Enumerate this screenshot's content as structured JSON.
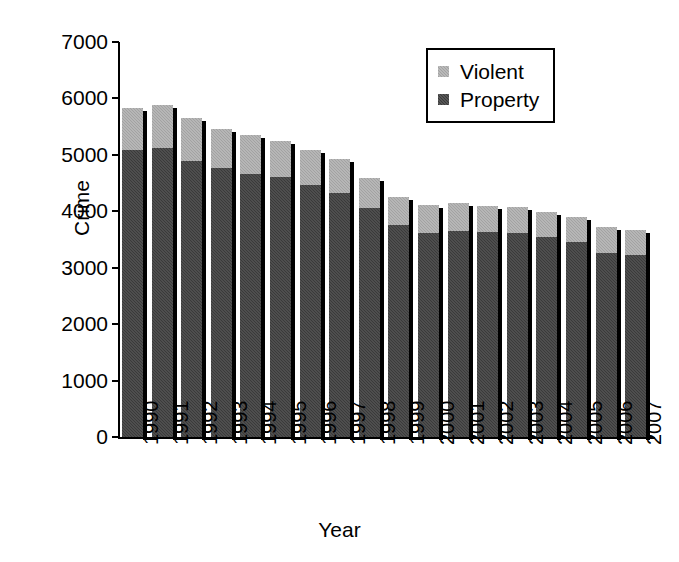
{
  "chart_data": {
    "type": "bar",
    "title": "",
    "subtitle": "",
    "stacked": true,
    "xlabel": "Year",
    "ylabel": "Crime",
    "ylim": [
      0,
      7000
    ],
    "ytick_step": 1000,
    "yticks": [
      "7000",
      "6000",
      "5000",
      "4000",
      "3000",
      "2000",
      "1000",
      "0"
    ],
    "grid": false,
    "legend_position": "top-right",
    "categories": [
      "1990",
      "1991",
      "1992",
      "1993",
      "1994",
      "1995",
      "1996",
      "1997",
      "1998",
      "1999",
      "2000",
      "2001",
      "2002",
      "2003",
      "2004",
      "2005",
      "2006",
      "2007"
    ],
    "series": [
      {
        "name": "Property",
        "color": "#3a3a3a",
        "values": [
          5090,
          5120,
          4900,
          4760,
          4660,
          4600,
          4470,
          4320,
          4060,
          3750,
          3620,
          3650,
          3640,
          3620,
          3540,
          3450,
          3260,
          3220
        ]
      },
      {
        "name": "Violent",
        "color": "#a2a2a2",
        "values": [
          740,
          760,
          760,
          690,
          700,
          640,
          620,
          600,
          530,
          500,
          500,
          490,
          460,
          450,
          450,
          450,
          460,
          450
        ]
      }
    ],
    "totals": [
      5830,
      5880,
      5660,
      5450,
      5360,
      5240,
      5090,
      4920,
      4590,
      4250,
      4120,
      4140,
      4100,
      4070,
      3990,
      3900,
      3720,
      3670
    ]
  },
  "legend": {
    "entries": [
      {
        "label": "Violent",
        "swatch": "violent"
      },
      {
        "label": "Property",
        "swatch": "property"
      }
    ]
  },
  "axes": {
    "y_title": "Crime",
    "x_title": "Year"
  }
}
